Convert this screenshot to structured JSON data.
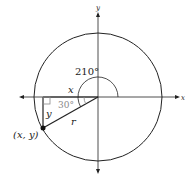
{
  "diagram": {
    "axis_labels": {
      "x": "x",
      "y": "y"
    },
    "angle_label": "210°",
    "reference_angle_label": "30°",
    "side_labels": {
      "adjacent": "x",
      "opposite": "y",
      "hypotenuse": "r"
    },
    "point_label": "(x, y)",
    "colors": {
      "stroke": "#222222",
      "reference_angle": "#888888"
    }
  }
}
